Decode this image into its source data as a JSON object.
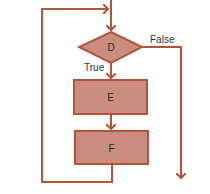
{
  "diagram": {
    "type": "flowchart",
    "colors": {
      "stroke": "#b4553a",
      "fill": "#c98e80",
      "text": "#333333",
      "background": "#ffffff"
    },
    "nodes": [
      {
        "id": "D",
        "shape": "diamond",
        "label": "D"
      },
      {
        "id": "E",
        "shape": "rectangle",
        "label": "E"
      },
      {
        "id": "F",
        "shape": "rectangle",
        "label": "F"
      }
    ],
    "edges": [
      {
        "from": "entry",
        "to": "D",
        "label": ""
      },
      {
        "from": "D",
        "to": "E",
        "label": "True"
      },
      {
        "from": "D",
        "to": "exit",
        "label": "False"
      },
      {
        "from": "E",
        "to": "F",
        "label": ""
      },
      {
        "from": "F",
        "to": "D",
        "label": "",
        "note": "loop back to entry"
      }
    ],
    "labels": {
      "true": "True",
      "false": "False",
      "d": "D",
      "e": "E",
      "f": "F"
    }
  }
}
